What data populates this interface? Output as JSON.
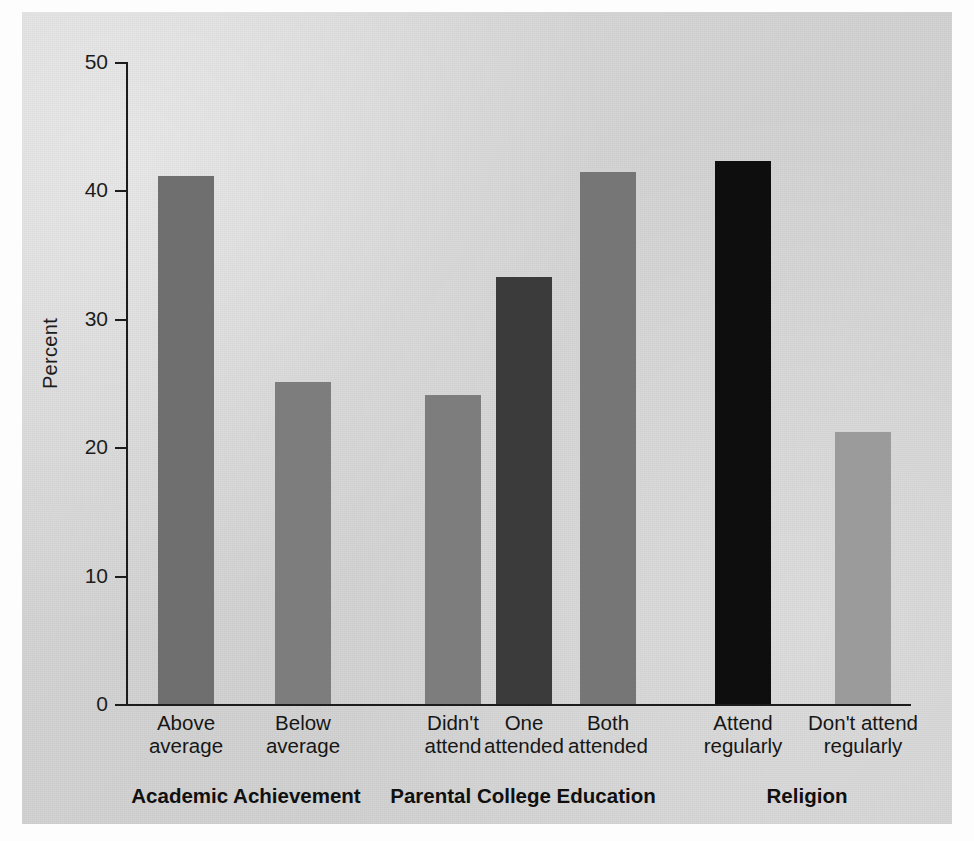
{
  "chart_data": {
    "type": "bar",
    "title": "",
    "xlabel": "",
    "ylabel": "Percent",
    "ylim": [
      0,
      50
    ],
    "yticks": [
      0,
      10,
      20,
      30,
      40,
      50
    ],
    "grid": false,
    "legend": "none",
    "categories": [
      "Above average",
      "Below average",
      "Didn't attend",
      "One attended",
      "Both attended",
      "Attend regularly",
      "Don't attend regularly"
    ],
    "values": [
      41.1,
      25.1,
      24.1,
      33.2,
      41.4,
      42.2,
      21.2
    ],
    "groups": [
      {
        "name": "Academic Achievement",
        "categories": [
          "Above average",
          "Below average"
        ]
      },
      {
        "name": "Parental College Education",
        "categories": [
          "Didn't attend",
          "One attended",
          "Both attended"
        ]
      },
      {
        "name": "Religion",
        "categories": [
          "Attend regularly",
          "Don't attend regularly"
        ]
      }
    ]
  },
  "axis": {
    "y_title": "Percent",
    "y_tick_labels": [
      "50",
      "40",
      "30",
      "20",
      "10",
      "0"
    ]
  },
  "bars": [
    {
      "id": "bar-above-average",
      "line1": "Above",
      "line2": "average",
      "value": 41.1,
      "color": "#6f6f6f"
    },
    {
      "id": "bar-below-average",
      "line1": "Below",
      "line2": "average",
      "value": 25.1,
      "color": "#7d7d7d"
    },
    {
      "id": "bar-didnt-attend",
      "line1": "Didn't",
      "line2": "attend",
      "value": 24.1,
      "color": "#7d7d7d"
    },
    {
      "id": "bar-one-attended",
      "line1": "One",
      "line2": "attended",
      "value": 33.2,
      "color": "#3b3b3b"
    },
    {
      "id": "bar-both-attended",
      "line1": "Both",
      "line2": "attended",
      "value": 41.4,
      "color": "#767676"
    },
    {
      "id": "bar-attend-regularly",
      "line1": "Attend",
      "line2": "regularly",
      "value": 42.2,
      "color": "#0e0e0e"
    },
    {
      "id": "bar-dont-attend-regularly",
      "line1": "Don't attend",
      "line2": "regularly",
      "value": 21.2,
      "color": "#9b9b9b"
    }
  ],
  "groups": [
    {
      "id": "group-academic-achievement",
      "label": "Academic Achievement"
    },
    {
      "id": "group-parental-college",
      "label": "Parental College Education"
    },
    {
      "id": "group-religion",
      "label": "Religion"
    }
  ],
  "colors": {
    "plate_background": "#d3d3d3",
    "page_background": "#fdfdfd",
    "axis": "#1c1c1c",
    "text": "#141414"
  }
}
